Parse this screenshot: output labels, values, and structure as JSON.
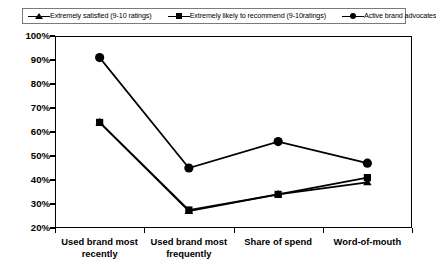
{
  "chart_data": {
    "type": "line",
    "title": "",
    "subtitle": "",
    "xlabel": "",
    "ylabel": "",
    "ylim": [
      20,
      100
    ],
    "ytick_labels": [
      "100%",
      "90%",
      "80%",
      "70%",
      "60%",
      "50%",
      "40%",
      "30%",
      "20%"
    ],
    "ytick_values": [
      100,
      90,
      80,
      70,
      60,
      50,
      40,
      30,
      20
    ],
    "grid": false,
    "legend_position": "top",
    "categories": [
      "Used brand most recently",
      "Used brand most frequently",
      "Share of spend",
      "Word-of-mouth"
    ],
    "category_lines": [
      [
        "Used brand most",
        "recently"
      ],
      [
        "Used brand most",
        "frequently"
      ],
      [
        "Share of spend"
      ],
      [
        "Word-of-mouth"
      ]
    ],
    "series": [
      {
        "name": "Extremely satisfied (9-10 ratings)",
        "marker": "triangle",
        "values": [
          64,
          27,
          34,
          39
        ]
      },
      {
        "name": "Extremely likely to recommend (9-10ratings)",
        "marker": "square",
        "values": [
          64,
          27.5,
          34,
          41
        ]
      },
      {
        "name": "Active brand advocates",
        "marker": "circle",
        "values": [
          91,
          45,
          56,
          47
        ]
      }
    ],
    "line_color": "#000000",
    "marker_color": "#000000",
    "background_color": "#ffffff",
    "axis_color": "#000000"
  },
  "legend": {
    "entries": [
      {
        "label": "Extremely satisfied (9-10 ratings)",
        "marker": "triangle-marker"
      },
      {
        "label": "Extremely likely to recommend (9-10ratings)",
        "marker": "square-marker"
      },
      {
        "label": "Active brand advocates",
        "marker": "circle-marker"
      }
    ]
  }
}
